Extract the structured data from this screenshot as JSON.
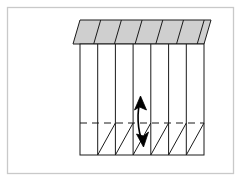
{
  "image": {
    "width": 241,
    "height": 182,
    "background_color": "#ffffff",
    "caption": ""
  },
  "frame": {
    "name": "figure-border",
    "x": 7.5,
    "y": 7.5,
    "width": 226,
    "height": 166,
    "stroke_color": "#c9c9c9",
    "stroke_width": 1.3,
    "fill": "none"
  },
  "diagram": {
    "type": "technical-line-drawing",
    "stroke_color": "#1a1a1a",
    "fill_color": "#ffffff",
    "line_width": 1.0
  },
  "top_face": {
    "name": "roof-parallelogram",
    "fill_color": "#cfcfcf",
    "stroke_color": "#1a1a1a",
    "points": "80,20 211,20 204,44 73,44",
    "segment_count": 7,
    "segment_line_color": "#1a1a1a",
    "segment_lines": [
      "100.7,20 93.7,44",
      "121.4,20 114.4,44",
      "142.1,20 135.1,44",
      "162.8,20 155.8,44",
      "183.5,20 176.5,44",
      "204.2,20 197.2,44"
    ]
  },
  "front_face": {
    "name": "panel-front",
    "x": 80,
    "y": 44,
    "width": 124,
    "height": 111,
    "fill_color": "#ffffff",
    "stroke_color": "#1a1a1a",
    "column_count": 7,
    "column_divider_x": [
      97.7,
      115.4,
      133.1,
      150.8,
      168.6,
      186.3
    ]
  },
  "dashed_line": {
    "name": "horizontal-dashed-divider",
    "y": 123,
    "x1": 80,
    "x2": 204,
    "stroke_color": "#1a1a1a",
    "dash_pattern": "7,5",
    "stroke_width": 1.0
  },
  "hatch_diagonals": {
    "name": "lower-band-diagonals",
    "description": "diagonal lines in lower band, rising left-to-right, one per column except the first",
    "stroke_color": "#1a1a1a",
    "stroke_width": 1.0,
    "lines": [
      "97.7,155 115.4,123",
      "115.4,155 133.1,123",
      "133.1,155 150.8,123",
      "150.8,155 168.6,123",
      "168.6,155 186.3,123",
      "186.3,155 204,123"
    ]
  },
  "dimension_arrow": {
    "name": "double-headed-curved-arrow",
    "description": "slightly curved vertical double-headed arrow spanning the dashed divider inside column 4",
    "stroke_color": "#000000",
    "fill_color": "#000000",
    "stroke_width": 1.6,
    "path": "M 140.5,101 C 136.5,112 137.5,130 142.5,142",
    "top_arrowhead": "140.5,96 146.5,110 139.5,107 134.5,110",
    "bottom_arrowhead": "143.5,147 136.5,134 143.5,136 148.5,132"
  }
}
